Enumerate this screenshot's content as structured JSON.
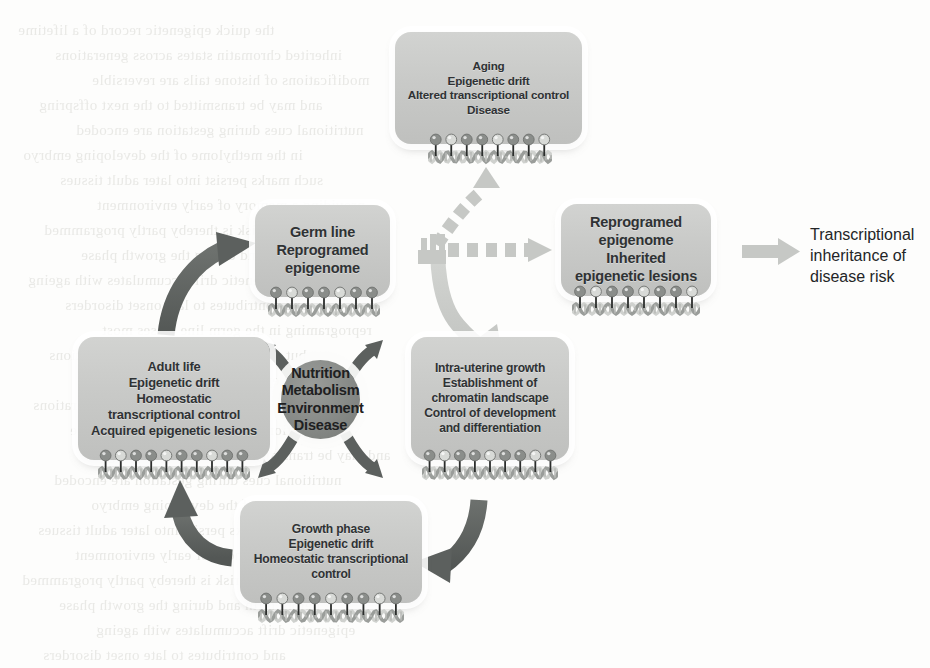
{
  "diagram": {
    "colors": {
      "background": "#fdfdfc",
      "box_fill": "#c9cac8",
      "box_halo": "#ffffff",
      "hub_fill": "#878a87",
      "dark_arrow": "#5f6361",
      "light_arrow": "#c8cac7",
      "text": "#2f3234",
      "nucleosome_dark": "#8a8d8a",
      "nucleosome_light": "#d8dad7"
    }
  },
  "nodes": {
    "aging": {
      "name": "aging-box",
      "lines": [
        "Aging",
        "Epigenetic drift",
        "Altered transcriptional control",
        "Disease"
      ]
    },
    "germ_line": {
      "name": "germ-line-box",
      "lines": [
        "Germ line",
        "Reprogramed",
        "epigenome"
      ]
    },
    "reprogramed": {
      "name": "reprogramed-epigenome-box",
      "lines": [
        "Reprogramed",
        "epigenome",
        "Inherited",
        "epigenetic lesions"
      ]
    },
    "adult_life": {
      "name": "adult-life-box",
      "lines": [
        "Adult life",
        "Epigenetic drift",
        "Homeostatic",
        "transcriptional control",
        "Acquired epigenetic lesions"
      ]
    },
    "intra_uterine": {
      "name": "intra-uterine-growth-box",
      "lines": [
        "Intra-uterine growth",
        "Establishment of",
        "chromatin landscape",
        "Control of development",
        "and differentiation"
      ]
    },
    "growth_phase": {
      "name": "growth-phase-box",
      "lines": [
        "Growth phase",
        "Epigenetic drift",
        "Homeostatic transcriptional",
        "control"
      ]
    },
    "hub": {
      "name": "central-hub",
      "lines": [
        "Nutrition",
        "Metabolism",
        "Environment",
        "Disease"
      ]
    }
  },
  "captions": {
    "transcriptional_inheritance": {
      "name": "transcriptional-inheritance-caption",
      "lines": [
        "Transcriptional",
        "inheritance of",
        "disease risk"
      ]
    }
  },
  "arrows": [
    {
      "name": "arrow-adult-to-germline",
      "style": "solid-dark",
      "from": "adult_life",
      "to": "germ_line"
    },
    {
      "name": "arrow-germline-branch-up-to-aging",
      "style": "dashed-light",
      "from": "germ_line",
      "to": "aging"
    },
    {
      "name": "arrow-germline-branch-right-to-reprogramed",
      "style": "dashed-light",
      "from": "germ_line",
      "to": "reprogramed"
    },
    {
      "name": "arrow-germline-to-intrauterine",
      "style": "solid-light",
      "from": "germ_line",
      "to": "intra_uterine"
    },
    {
      "name": "arrow-intrauterine-to-growthphase",
      "style": "solid-dark",
      "from": "intra_uterine",
      "to": "growth_phase"
    },
    {
      "name": "arrow-growthphase-to-adult",
      "style": "solid-dark",
      "from": "growth_phase",
      "to": "adult_life"
    },
    {
      "name": "arrow-reprogramed-to-caption",
      "style": "straight-light",
      "from": "reprogramed",
      "to": "transcriptional_inheritance"
    },
    {
      "name": "hub-arrow-up-left",
      "style": "hub-radial-dark",
      "from": "hub",
      "to": "adult_life"
    },
    {
      "name": "hub-arrow-up-right",
      "style": "hub-radial-dark",
      "from": "hub",
      "to": "germ_line"
    },
    {
      "name": "hub-arrow-down-left",
      "style": "hub-radial-dark",
      "from": "hub",
      "to": "growth_phase"
    },
    {
      "name": "hub-arrow-down-right",
      "style": "hub-radial-dark",
      "from": "hub",
      "to": "intra_uterine"
    }
  ],
  "bleed_text": {
    "name": "page-bleed-through",
    "lines": [
      "the quick epigenetic record of a lifetime",
      "inherited chromatin states across generations",
      "modifications of histone tails are reversible",
      "and may be transmitted to the next offspring",
      "nutritional cues during gestation are encoded",
      "in the methylome of the developing embryo",
      "such marks persist into later adult tissues",
      "providing a memory of early environment",
      "disease risk is thereby partly programmed",
      "before birth and during the growth phase",
      "epigenetic drift accumulates with ageing",
      "and contributes to late onset disorders",
      "reprograming in the germ line erases most",
      "but not all of the acquired modifications"
    ]
  }
}
